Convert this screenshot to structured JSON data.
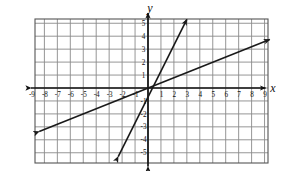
{
  "question_label": "D",
  "axes": {
    "x_axis_name": "x",
    "y_axis_name": "y",
    "x_tick_labels": [
      "-9",
      "-8",
      "-7",
      "-6",
      "-5",
      "-4",
      "-3",
      "-2",
      "-1",
      "1",
      "2",
      "3",
      "4",
      "5",
      "6",
      "7",
      "8",
      "9"
    ],
    "y_tick_labels": [
      "5",
      "4",
      "3",
      "2",
      "1",
      "-1",
      "-2",
      "-3",
      "-4",
      "-5"
    ]
  },
  "colors": {
    "grid": "#8a8a8a",
    "grid_minor": "#b9b9b9",
    "axis": "#111111",
    "line": "#1a1a1a",
    "background": "#ffffff",
    "border": "#555555"
  },
  "chart_data": {
    "type": "line",
    "title": "",
    "xlabel": "x",
    "ylabel": "y",
    "grid": true,
    "legend": "none",
    "xlim": [
      -9.75,
      9.75
    ],
    "ylim": [
      -5.75,
      5.75
    ],
    "xticks": [
      -9,
      -8,
      -7,
      -6,
      -5,
      -4,
      -3,
      -2,
      -1,
      1,
      2,
      3,
      4,
      5,
      6,
      7,
      8,
      9
    ],
    "yticks": [
      5,
      4,
      3,
      2,
      1,
      -1,
      -2,
      -3,
      -4,
      -5
    ],
    "series": [
      {
        "name": "steep-line",
        "equation": "y = 2x",
        "slope": 2,
        "intercept": 0,
        "arrow_start": [
          -2.3,
          -5.3
        ],
        "arrow_end": [
          3.0,
          5.3
        ],
        "points": [
          [
            -2.3,
            -5.3
          ],
          [
            0,
            0
          ],
          [
            3.0,
            5.3
          ]
        ]
      },
      {
        "name": "shallow-line",
        "equation": "y = 0.4x",
        "slope": 0.4,
        "intercept": 0,
        "arrow_start": [
          -8.4,
          -3.35
        ],
        "arrow_end": [
          9.4,
          3.75
        ],
        "points": [
          [
            -8.4,
            -3.35
          ],
          [
            0,
            0
          ],
          [
            9.4,
            3.75
          ]
        ]
      }
    ]
  }
}
